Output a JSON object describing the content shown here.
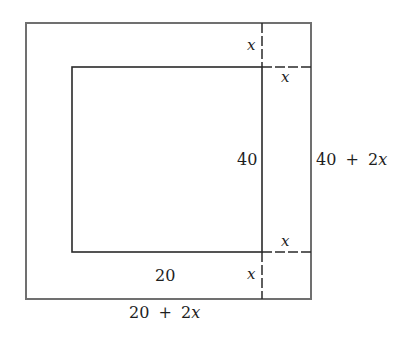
{
  "diagram": {
    "inner_rect": {
      "width_label": "20",
      "height_label": "40"
    },
    "outer_rect": {
      "width_label_parts": [
        "20",
        "+",
        "2",
        "x"
      ],
      "height_label_parts": [
        "40",
        "+",
        "2",
        "x"
      ]
    },
    "border_labels": {
      "top_x": "x",
      "top_right_x": "x",
      "bottom_right_x": "x",
      "bottom_x": "x"
    },
    "colors": {
      "outer_stroke": "#707070",
      "inner_stroke": "#2a2a2a",
      "text": "#1e1e1e"
    }
  }
}
